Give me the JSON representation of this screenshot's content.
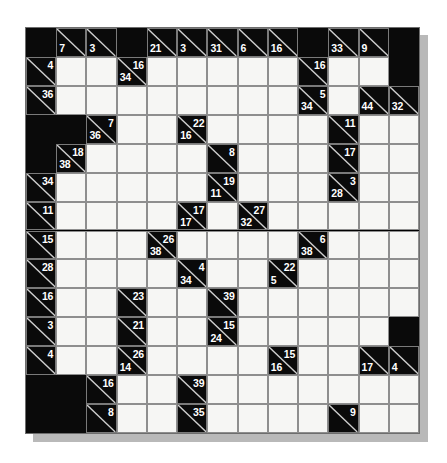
{
  "puzzle": {
    "type": "kakuro",
    "title": "Kakuro Puzzle Grid",
    "columns": 13,
    "rows": 14,
    "colors": {
      "block": "#0a0a0a",
      "entry": "#f6f6f4",
      "gridline": "#8e8e8e",
      "diagonal": "#cfcfcf",
      "clue_text": "#ffffff",
      "page_background": "#ffffff",
      "shadow": "#b9b9b9"
    },
    "legend": {
      "across_position": "upper-right of clue cell",
      "down_position": "lower-left of clue cell"
    },
    "grid": [
      [
        {
          "t": "black"
        },
        {
          "t": "clue",
          "down": "7"
        },
        {
          "t": "clue",
          "down": "3"
        },
        {
          "t": "black"
        },
        {
          "t": "clue",
          "down": "21"
        },
        {
          "t": "clue",
          "down": "3"
        },
        {
          "t": "clue",
          "down": "31"
        },
        {
          "t": "clue",
          "down": "6"
        },
        {
          "t": "clue",
          "down": "16"
        },
        {
          "t": "black"
        },
        {
          "t": "clue",
          "down": "33"
        },
        {
          "t": "clue",
          "down": "9"
        },
        {
          "t": "black"
        }
      ],
      [
        {
          "t": "clue",
          "across": "4"
        },
        {
          "t": "white"
        },
        {
          "t": "white"
        },
        {
          "t": "clue",
          "across": "16",
          "down": "34"
        },
        {
          "t": "white"
        },
        {
          "t": "white"
        },
        {
          "t": "white"
        },
        {
          "t": "white"
        },
        {
          "t": "white"
        },
        {
          "t": "clue",
          "across": "16"
        },
        {
          "t": "white"
        },
        {
          "t": "white"
        },
        {
          "t": "black"
        }
      ],
      [
        {
          "t": "clue",
          "across": "36"
        },
        {
          "t": "white"
        },
        {
          "t": "white"
        },
        {
          "t": "white"
        },
        {
          "t": "white"
        },
        {
          "t": "white"
        },
        {
          "t": "white"
        },
        {
          "t": "white"
        },
        {
          "t": "white"
        },
        {
          "t": "clue",
          "across": "5",
          "down": "34"
        },
        {
          "t": "white"
        },
        {
          "t": "clue",
          "down": "44"
        },
        {
          "t": "clue",
          "down": "32"
        }
      ],
      [
        {
          "t": "black"
        },
        {
          "t": "black"
        },
        {
          "t": "clue",
          "across": "7",
          "down": "36"
        },
        {
          "t": "white"
        },
        {
          "t": "white"
        },
        {
          "t": "clue",
          "across": "22",
          "down": "16"
        },
        {
          "t": "white"
        },
        {
          "t": "white"
        },
        {
          "t": "white"
        },
        {
          "t": "white"
        },
        {
          "t": "clue",
          "across": "11"
        },
        {
          "t": "white"
        },
        {
          "t": "white"
        }
      ],
      [
        {
          "t": "black"
        },
        {
          "t": "clue",
          "across": "18",
          "down": "38"
        },
        {
          "t": "white"
        },
        {
          "t": "white"
        },
        {
          "t": "white"
        },
        {
          "t": "white"
        },
        {
          "t": "clue",
          "across": "8"
        },
        {
          "t": "white"
        },
        {
          "t": "white"
        },
        {
          "t": "white"
        },
        {
          "t": "clue",
          "across": "17"
        },
        {
          "t": "white"
        },
        {
          "t": "white"
        }
      ],
      [
        {
          "t": "clue",
          "across": "34"
        },
        {
          "t": "white"
        },
        {
          "t": "white"
        },
        {
          "t": "white"
        },
        {
          "t": "white"
        },
        {
          "t": "white"
        },
        {
          "t": "clue",
          "across": "19",
          "down": "11"
        },
        {
          "t": "white"
        },
        {
          "t": "white"
        },
        {
          "t": "white"
        },
        {
          "t": "clue",
          "across": "3",
          "down": "28"
        },
        {
          "t": "white"
        },
        {
          "t": "white"
        }
      ],
      [
        {
          "t": "clue",
          "across": "11"
        },
        {
          "t": "white"
        },
        {
          "t": "white"
        },
        {
          "t": "white"
        },
        {
          "t": "white"
        },
        {
          "t": "clue",
          "across": "17",
          "down": "17"
        },
        {
          "t": "white"
        },
        {
          "t": "clue",
          "across": "27",
          "down": "32"
        },
        {
          "t": "white"
        },
        {
          "t": "white"
        },
        {
          "t": "white"
        },
        {
          "t": "white"
        },
        {
          "t": "white"
        }
      ],
      [
        {
          "t": "clue",
          "across": "15"
        },
        {
          "t": "white"
        },
        {
          "t": "white"
        },
        {
          "t": "white"
        },
        {
          "t": "clue",
          "across": "26",
          "down": "38"
        },
        {
          "t": "white"
        },
        {
          "t": "white"
        },
        {
          "t": "white"
        },
        {
          "t": "white"
        },
        {
          "t": "clue",
          "across": "6",
          "down": "38"
        },
        {
          "t": "white"
        },
        {
          "t": "white"
        },
        {
          "t": "white"
        }
      ],
      [
        {
          "t": "clue",
          "across": "28"
        },
        {
          "t": "white"
        },
        {
          "t": "white"
        },
        {
          "t": "white"
        },
        {
          "t": "white"
        },
        {
          "t": "clue",
          "across": "4",
          "down": "34"
        },
        {
          "t": "white"
        },
        {
          "t": "white"
        },
        {
          "t": "clue",
          "across": "22",
          "down": "5"
        },
        {
          "t": "white"
        },
        {
          "t": "white"
        },
        {
          "t": "white"
        },
        {
          "t": "white"
        }
      ],
      [
        {
          "t": "clue",
          "across": "16"
        },
        {
          "t": "white"
        },
        {
          "t": "white"
        },
        {
          "t": "clue",
          "across": "23"
        },
        {
          "t": "white"
        },
        {
          "t": "white"
        },
        {
          "t": "clue",
          "across": "39"
        },
        {
          "t": "white"
        },
        {
          "t": "white"
        },
        {
          "t": "white"
        },
        {
          "t": "white"
        },
        {
          "t": "white"
        },
        {
          "t": "white"
        }
      ],
      [
        {
          "t": "clue",
          "across": "3"
        },
        {
          "t": "white"
        },
        {
          "t": "white"
        },
        {
          "t": "clue",
          "across": "21"
        },
        {
          "t": "white"
        },
        {
          "t": "white"
        },
        {
          "t": "clue",
          "across": "15",
          "down": "24"
        },
        {
          "t": "white"
        },
        {
          "t": "white"
        },
        {
          "t": "white"
        },
        {
          "t": "white"
        },
        {
          "t": "white"
        },
        {
          "t": "black"
        }
      ],
      [
        {
          "t": "clue",
          "across": "4"
        },
        {
          "t": "white"
        },
        {
          "t": "white"
        },
        {
          "t": "clue",
          "across": "26",
          "down": "14"
        },
        {
          "t": "white"
        },
        {
          "t": "white"
        },
        {
          "t": "white"
        },
        {
          "t": "white"
        },
        {
          "t": "clue",
          "across": "15",
          "down": "16"
        },
        {
          "t": "white"
        },
        {
          "t": "white"
        },
        {
          "t": "clue",
          "down": "17"
        },
        {
          "t": "clue",
          "down": "4"
        }
      ],
      [
        {
          "t": "black"
        },
        {
          "t": "black"
        },
        {
          "t": "clue",
          "across": "16"
        },
        {
          "t": "white"
        },
        {
          "t": "white"
        },
        {
          "t": "clue",
          "across": "39"
        },
        {
          "t": "white"
        },
        {
          "t": "white"
        },
        {
          "t": "white"
        },
        {
          "t": "white"
        },
        {
          "t": "white"
        },
        {
          "t": "white"
        },
        {
          "t": "white"
        }
      ],
      [
        {
          "t": "black"
        },
        {
          "t": "black"
        },
        {
          "t": "clue",
          "across": "8"
        },
        {
          "t": "white"
        },
        {
          "t": "white"
        },
        {
          "t": "clue",
          "across": "35"
        },
        {
          "t": "white"
        },
        {
          "t": "white"
        },
        {
          "t": "white"
        },
        {
          "t": "white"
        },
        {
          "t": "clue",
          "across": "9"
        },
        {
          "t": "white"
        },
        {
          "t": "white"
        }
      ]
    ]
  }
}
